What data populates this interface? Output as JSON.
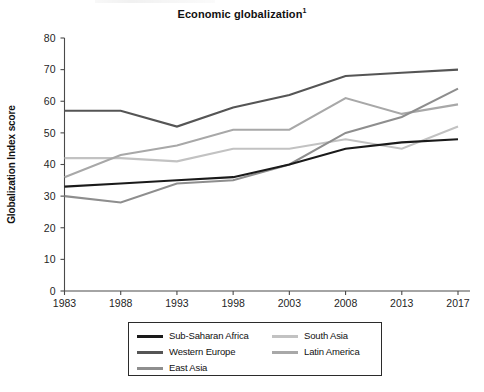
{
  "chart_data": {
    "type": "line",
    "title": "Economic globalization",
    "title_footnote_marker": "1",
    "xlabel": "",
    "ylabel": "Globalization Index score",
    "categories": [
      "1983",
      "1988",
      "1993",
      "1998",
      "2003",
      "2008",
      "2013",
      "2017"
    ],
    "x_tick_labels": [
      "1983",
      "1988",
      "1993",
      "1998",
      "2003",
      "2008",
      "2013",
      "2017"
    ],
    "y_tick_labels": [
      "0",
      "10",
      "20",
      "30",
      "40",
      "50",
      "60",
      "70",
      "80"
    ],
    "ylim": [
      0,
      80
    ],
    "y_tick_step": 10,
    "grid": false,
    "legend_position": "bottom-center",
    "series": [
      {
        "name": "Sub-Saharan Africa",
        "color": "#1a1a1a",
        "values": [
          33,
          34,
          35,
          36,
          40,
          45,
          47,
          48
        ]
      },
      {
        "name": "Western Europe",
        "color": "#555555",
        "values": [
          57,
          57,
          52,
          58,
          62,
          68,
          69,
          70
        ]
      },
      {
        "name": "East Asia",
        "color": "#8e8e8e",
        "values": [
          30,
          28,
          34,
          35,
          40,
          50,
          55,
          64
        ]
      },
      {
        "name": "South Asia",
        "color": "#c2c2c2",
        "values": [
          42,
          42,
          41,
          45,
          45,
          48,
          45,
          52
        ]
      },
      {
        "name": "Latin America",
        "color": "#a8a8a8",
        "values": [
          36,
          43,
          46,
          51,
          51,
          61,
          56,
          59
        ]
      }
    ]
  },
  "legend": {
    "items": [
      {
        "label": "Sub-Saharan Africa",
        "color": "#1a1a1a"
      },
      {
        "label": "South Asia",
        "color": "#c2c2c2"
      },
      {
        "label": "Western Europe",
        "color": "#555555"
      },
      {
        "label": "Latin America",
        "color": "#a8a8a8"
      },
      {
        "label": "East Asia",
        "color": "#8e8e8e"
      }
    ]
  },
  "colors": {
    "axis": "#4a4a4a",
    "text": "#111111",
    "background": "#ffffff"
  }
}
